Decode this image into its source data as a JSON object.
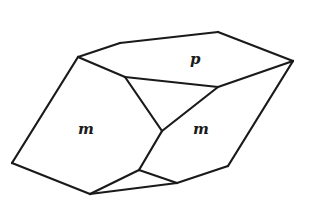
{
  "diagram": {
    "type": "crystal-form",
    "faces": [
      {
        "id": "p",
        "label": "p",
        "x": 190,
        "y": 64
      },
      {
        "id": "m-left",
        "label": "m",
        "x": 78,
        "y": 134
      },
      {
        "id": "m-right",
        "label": "m",
        "x": 193,
        "y": 134
      }
    ],
    "vertices": {
      "A": [
        78,
        57
      ],
      "B": [
        120,
        43
      ],
      "C": [
        218,
        32
      ],
      "D": [
        293,
        61
      ],
      "E": [
        125,
        77
      ],
      "F": [
        218,
        87
      ],
      "G": [
        162,
        131
      ],
      "H": [
        12,
        163
      ],
      "I": [
        90,
        194
      ],
      "J": [
        139,
        170
      ],
      "K": [
        177,
        183
      ],
      "L": [
        228,
        166
      ]
    },
    "edges": [
      [
        "A",
        "B"
      ],
      [
        "B",
        "C"
      ],
      [
        "C",
        "D"
      ],
      [
        "A",
        "E"
      ],
      [
        "E",
        "F"
      ],
      [
        "F",
        "D"
      ],
      [
        "E",
        "G"
      ],
      [
        "F",
        "G"
      ],
      [
        "A",
        "H"
      ],
      [
        "H",
        "I"
      ],
      [
        "G",
        "J"
      ],
      [
        "I",
        "J"
      ],
      [
        "J",
        "K"
      ],
      [
        "I",
        "K"
      ],
      [
        "K",
        "L"
      ],
      [
        "L",
        "D"
      ]
    ],
    "line_color": "#1a1a1a",
    "background": "#ffffff"
  }
}
